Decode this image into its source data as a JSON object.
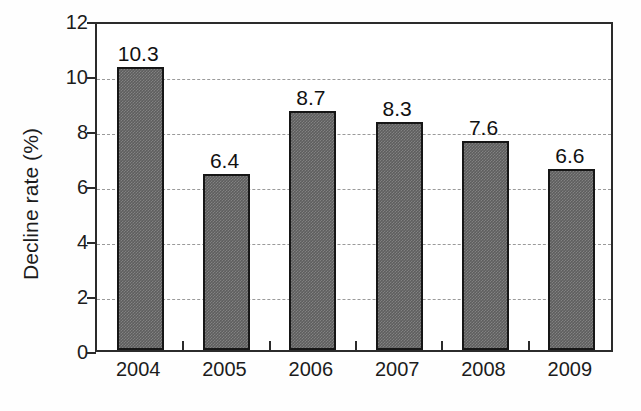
{
  "chart_data": {
    "type": "bar",
    "title": "",
    "subtitle": "",
    "xlabel": "",
    "ylabel": "Decline rate (%)",
    "categories": [
      "2004",
      "2005",
      "2006",
      "2007",
      "2008",
      "2009"
    ],
    "values": [
      10.3,
      6.4,
      8.7,
      8.3,
      7.6,
      6.6
    ],
    "data_labels": [
      "10.3",
      "6.4",
      "8.7",
      "8.3",
      "7.6",
      "6.6"
    ],
    "ylim": [
      0,
      12
    ],
    "y_ticks": [
      0,
      2,
      4,
      6,
      8,
      10,
      12
    ],
    "y_tick_labels": [
      "0",
      "2",
      "4",
      "6",
      "8",
      "10",
      "12"
    ],
    "grid": true,
    "grid_axis": "y",
    "grid_style": "dashed",
    "legend": false,
    "legend_position": "none",
    "bar_fill_color": "#5e5e5e",
    "bar_edge_color": "#161616",
    "grid_color": "#9a9a9a",
    "axis_color": "#2b2b2b",
    "background_color": "#ffffff"
  }
}
